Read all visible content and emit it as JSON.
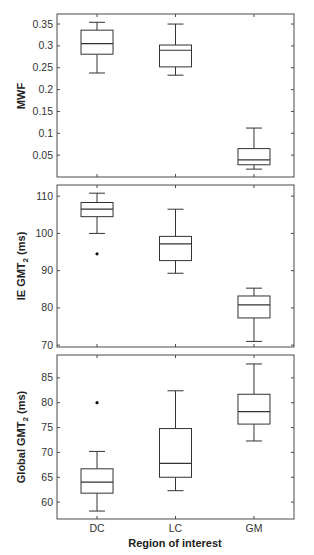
{
  "chart_data": [
    {
      "type": "box",
      "title": "",
      "ylabel": "MWF",
      "xlabel": "",
      "categories": [
        "DC",
        "LC",
        "GM"
      ],
      "show_x_tick_labels": false,
      "ylim": [
        0,
        0.373
      ],
      "yticks": [
        0.05,
        0.1,
        0.15,
        0.2,
        0.25,
        0.3,
        0.35
      ],
      "ytick_labels": [
        "0.05",
        "0.1",
        "0.15",
        "0.2",
        "0.25",
        "0.3",
        "0.35"
      ],
      "grid": false,
      "boxes": [
        {
          "category": "DC",
          "whisker_low": 0.238,
          "q1": 0.281,
          "median": 0.305,
          "q3": 0.336,
          "whisker_high": 0.354,
          "outliers": []
        },
        {
          "category": "LC",
          "whisker_low": 0.233,
          "q1": 0.252,
          "median": 0.29,
          "q3": 0.302,
          "whisker_high": 0.35,
          "outliers": []
        },
        {
          "category": "GM",
          "whisker_low": 0.018,
          "q1": 0.028,
          "median": 0.039,
          "q3": 0.065,
          "whisker_high": 0.112,
          "outliers": []
        }
      ]
    },
    {
      "type": "box",
      "title": "",
      "ylabel_main": "IE GMT",
      "ylabel_sub": "2",
      "ylabel_suffix": " (ms)",
      "xlabel": "",
      "categories": [
        "DC",
        "LC",
        "GM"
      ],
      "show_x_tick_labels": false,
      "ylim": [
        69.5,
        113
      ],
      "yticks": [
        70,
        80,
        90,
        100,
        110
      ],
      "ytick_labels": [
        "70",
        "80",
        "90",
        "100",
        "110"
      ],
      "grid": false,
      "boxes": [
        {
          "category": "DC",
          "whisker_low": 100,
          "q1": 104.5,
          "median": 106.5,
          "q3": 108.3,
          "whisker_high": 110.8,
          "outliers": [
            94.5
          ]
        },
        {
          "category": "LC",
          "whisker_low": 89.3,
          "q1": 92.7,
          "median": 97.2,
          "q3": 99.2,
          "whisker_high": 106.5,
          "outliers": []
        },
        {
          "category": "GM",
          "whisker_low": 71,
          "q1": 77.3,
          "median": 80.8,
          "q3": 83.2,
          "whisker_high": 85.3,
          "outliers": []
        }
      ]
    },
    {
      "type": "box",
      "title": "",
      "ylabel_main": "Global GMT",
      "ylabel_sub": "2",
      "ylabel_suffix": " (ms)",
      "xlabel": "Region of interest",
      "categories": [
        "DC",
        "LC",
        "GM"
      ],
      "show_x_tick_labels": true,
      "ylim": [
        56.6,
        89.6
      ],
      "yticks": [
        60,
        65,
        70,
        75,
        80,
        85
      ],
      "ytick_labels": [
        "60",
        "65",
        "70",
        "75",
        "80",
        "85"
      ],
      "grid": false,
      "boxes": [
        {
          "category": "DC",
          "whisker_low": 58.2,
          "q1": 61.8,
          "median": 64,
          "q3": 66.7,
          "whisker_high": 70.2,
          "outliers": [
            80
          ]
        },
        {
          "category": "LC",
          "whisker_low": 62.3,
          "q1": 65,
          "median": 67.8,
          "q3": 74.8,
          "whisker_high": 82.4,
          "outliers": []
        },
        {
          "category": "GM",
          "whisker_low": 72.3,
          "q1": 75.7,
          "median": 78.2,
          "q3": 81.7,
          "whisker_high": 87.8,
          "outliers": []
        }
      ]
    }
  ]
}
